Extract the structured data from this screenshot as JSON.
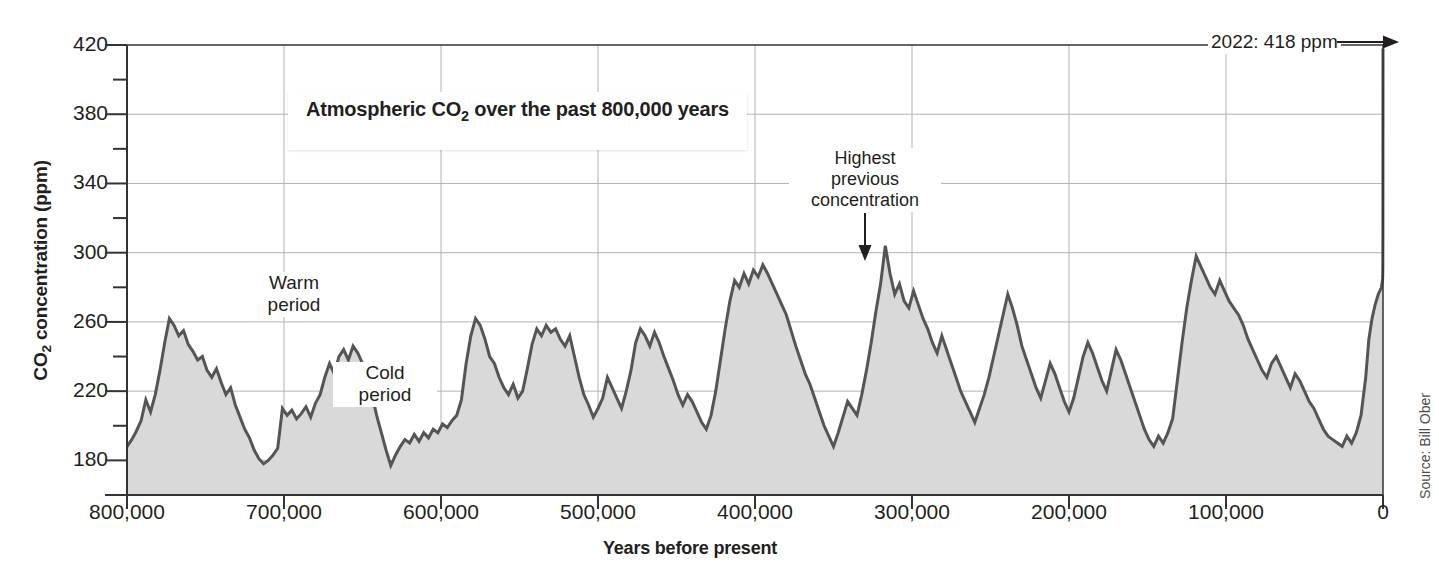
{
  "figure": {
    "source_note": "Source: Bill Ober"
  },
  "annotations": {
    "title": "Atmospheric CO2 over the past 800,000 years",
    "title_pre": "Atmospheric CO",
    "title_sub": "2",
    "title_post": " over the past 800,000 years",
    "present_day": "2022: 418 ppm",
    "highest_previous": "Highest\nprevious\nconcentration",
    "highest_previous_l1": "Highest",
    "highest_previous_l2": "previous",
    "highest_previous_l3": "concentration",
    "warm_period_l1": "Warm",
    "warm_period_l2": "period",
    "cold_period_l1": "Cold",
    "cold_period_l2": "period"
  },
  "colors": {
    "line": "#555555",
    "fill": "#d9d9d9",
    "axis": "#333333",
    "grid": "#b3b3b3",
    "text": "#231f20"
  },
  "chart_data": {
    "type": "area",
    "title": "Atmospheric CO2 over the past 800,000 years",
    "xlabel": "Years before present",
    "ylabel": "CO2 concentration (ppm)",
    "xlim": [
      800000,
      0
    ],
    "ylim": [
      160,
      420
    ],
    "x_reversed": true,
    "grid": true,
    "legend": "none",
    "xticks": [
      800000,
      700000,
      600000,
      500000,
      400000,
      300000,
      200000,
      100000,
      0
    ],
    "xtick_labels": [
      "800,000",
      "700,000",
      "600,000",
      "500,000",
      "400,000",
      "300,000",
      "200,000",
      "100,000",
      "0"
    ],
    "yticks": [
      180,
      220,
      260,
      300,
      340,
      380,
      420
    ],
    "ytick_labels": [
      "180",
      "220",
      "260",
      "300",
      "340",
      "380",
      "420"
    ],
    "y_minor_ticks": [
      160,
      200,
      240,
      280,
      320,
      360,
      400
    ],
    "annotations": [
      {
        "text": "2022: 418 ppm",
        "x": 0,
        "y": 418,
        "type": "arrow-right"
      },
      {
        "text": "Highest previous concentration",
        "x": 335000,
        "y": 305,
        "type": "arrow-down"
      },
      {
        "text": "Warm period",
        "x": 690000,
        "y": 262,
        "type": "label"
      },
      {
        "text": "Cold period",
        "x": 655000,
        "y": 228,
        "type": "label"
      }
    ],
    "series": [
      {
        "name": "CO2 concentration (ppm)",
        "units": "ppm",
        "x": [
          800000,
          797000,
          794000,
          791000,
          788000,
          785000,
          782000,
          779000,
          776000,
          773000,
          770000,
          767000,
          764000,
          761000,
          758000,
          755000,
          752000,
          749000,
          746000,
          743000,
          740000,
          737000,
          734000,
          731000,
          728000,
          725000,
          722000,
          719000,
          716000,
          713000,
          710000,
          707000,
          704000,
          701000,
          698000,
          695000,
          692000,
          689000,
          686000,
          683000,
          680000,
          677000,
          674000,
          671000,
          668000,
          665000,
          662000,
          659000,
          656000,
          653000,
          650000,
          647000,
          644000,
          641000,
          638000,
          635000,
          632000,
          629000,
          626000,
          623000,
          620000,
          617000,
          614000,
          611000,
          608000,
          605000,
          602000,
          599000,
          596000,
          593000,
          590000,
          587000,
          584000,
          581000,
          578000,
          575000,
          572000,
          569000,
          566000,
          563000,
          560000,
          557000,
          554000,
          551000,
          548000,
          545000,
          542000,
          539000,
          536000,
          533000,
          530000,
          527000,
          524000,
          521000,
          518000,
          515000,
          512000,
          509000,
          506000,
          503000,
          500000,
          497000,
          494000,
          491000,
          488000,
          485000,
          482000,
          479000,
          476000,
          473000,
          470000,
          467000,
          464000,
          461000,
          458000,
          455000,
          452000,
          449000,
          446000,
          443000,
          440000,
          437000,
          434000,
          431000,
          428000,
          425000,
          422000,
          419000,
          416000,
          413000,
          410000,
          407000,
          404000,
          401000,
          398000,
          395000,
          392000,
          389000,
          386000,
          383000,
          380000,
          377000,
          374000,
          371000,
          368000,
          365000,
          362000,
          359000,
          356000,
          353000,
          350000,
          347000,
          344000,
          341000,
          338000,
          335000,
          332000,
          329000,
          326000,
          323000,
          320000,
          317000,
          314000,
          311000,
          308000,
          305000,
          302000,
          299000,
          296000,
          293000,
          290000,
          287000,
          284000,
          281000,
          278000,
          275000,
          272000,
          269000,
          266000,
          263000,
          260000,
          257000,
          254000,
          251000,
          248000,
          245000,
          242000,
          239000,
          236000,
          233000,
          230000,
          227000,
          224000,
          221000,
          218000,
          215000,
          212000,
          209000,
          206000,
          203000,
          200000,
          197000,
          194000,
          191000,
          188000,
          185000,
          182000,
          179000,
          176000,
          173000,
          170000,
          167000,
          164000,
          161000,
          158000,
          155000,
          152000,
          149000,
          146000,
          143000,
          140000,
          137000,
          134000,
          131000,
          128000,
          125000,
          122000,
          119000,
          116000,
          113000,
          110000,
          107000,
          104000,
          101000,
          98000,
          95000,
          92000,
          89000,
          86000,
          83000,
          80000,
          77000,
          74000,
          71000,
          68000,
          65000,
          62000,
          59000,
          56000,
          53000,
          50000,
          47000,
          44000,
          41000,
          38000,
          35000,
          32000,
          29000,
          26000,
          23000,
          20000,
          17000,
          14000,
          11000,
          9000,
          7000,
          5000,
          3000,
          2000,
          1000,
          500,
          250,
          150,
          100,
          60,
          30,
          0
        ],
        "y": [
          188,
          192,
          197,
          203,
          215,
          208,
          218,
          232,
          248,
          262,
          258,
          252,
          255,
          247,
          243,
          238,
          240,
          232,
          228,
          233,
          225,
          218,
          222,
          212,
          205,
          198,
          193,
          186,
          181,
          178,
          180,
          183,
          187,
          210,
          206,
          209,
          204,
          207,
          211,
          205,
          213,
          218,
          228,
          236,
          230,
          240,
          244,
          238,
          246,
          242,
          236,
          226,
          218,
          206,
          196,
          186,
          177,
          183,
          188,
          192,
          190,
          195,
          191,
          196,
          193,
          198,
          196,
          201,
          199,
          203,
          206,
          215,
          236,
          252,
          262,
          258,
          250,
          240,
          236,
          228,
          222,
          218,
          224,
          216,
          220,
          233,
          247,
          256,
          252,
          258,
          254,
          256,
          250,
          246,
          252,
          240,
          228,
          218,
          212,
          205,
          210,
          216,
          228,
          222,
          216,
          210,
          220,
          232,
          248,
          256,
          252,
          246,
          254,
          248,
          240,
          233,
          226,
          218,
          212,
          218,
          214,
          208,
          202,
          198,
          206,
          220,
          238,
          256,
          272,
          284,
          280,
          288,
          282,
          290,
          286,
          293,
          288,
          282,
          276,
          270,
          264,
          255,
          246,
          238,
          230,
          224,
          216,
          208,
          200,
          194,
          188,
          196,
          205,
          214,
          210,
          206,
          218,
          232,
          248,
          266,
          282,
          304,
          288,
          276,
          282,
          272,
          268,
          278,
          270,
          262,
          256,
          248,
          242,
          252,
          244,
          236,
          228,
          220,
          214,
          208,
          202,
          210,
          218,
          228,
          240,
          252,
          264,
          276,
          268,
          258,
          246,
          238,
          230,
          222,
          216,
          226,
          236,
          230,
          222,
          214,
          208,
          216,
          228,
          240,
          248,
          242,
          234,
          226,
          220,
          232,
          244,
          238,
          230,
          222,
          214,
          206,
          198,
          192,
          188,
          194,
          190,
          196,
          204,
          226,
          248,
          268,
          284,
          298,
          292,
          286,
          280,
          276,
          284,
          278,
          272,
          268,
          264,
          258,
          250,
          244,
          238,
          232,
          228,
          236,
          240,
          234,
          228,
          222,
          230,
          226,
          220,
          214,
          210,
          204,
          198,
          194,
          192,
          190,
          188,
          194,
          190,
          196,
          206,
          228,
          250,
          262,
          270,
          276,
          278,
          280,
          283,
          285,
          288,
          294,
          310,
          360,
          418
        ]
      }
    ]
  }
}
